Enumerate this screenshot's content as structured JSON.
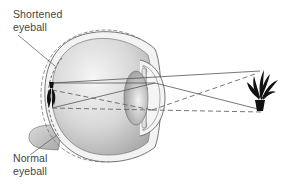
{
  "diagram": {
    "type": "anatomical-diagram",
    "labels": {
      "top": {
        "line1": "Shortened",
        "line2": "eyeball"
      },
      "bottom": {
        "line1": "Normal",
        "line2": "eyeball"
      }
    },
    "elements": [
      {
        "name": "eyeball",
        "description": "cross-section of eye with sclera, vitreous body, lens, iris and cornea"
      },
      {
        "name": "object-plant",
        "description": "potted plant silhouette at right, the viewed object"
      },
      {
        "name": "image-on-retina",
        "description": "small inverted plant image at back of eye"
      },
      {
        "name": "solid-ray-lines",
        "description": "light rays for shortened eyeball"
      },
      {
        "name": "dashed-ray-lines",
        "description": "light rays for normal eyeball"
      }
    ],
    "colors": {
      "outline": "#555555",
      "eye_fill_light": "#f2f2f2",
      "eye_fill_dark": "#b8b8b8",
      "lens_fill": "#c4c4c4",
      "ray_color": "#555555",
      "plant": "#111111",
      "optic_nerve": "#cfcfcf"
    }
  }
}
